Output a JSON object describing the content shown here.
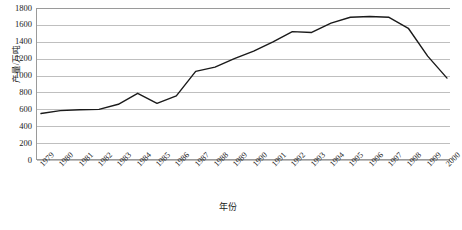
{
  "chart_data": {
    "type": "line",
    "title": "",
    "xlabel": "年份",
    "ylabel": "产量/万吨",
    "categories": [
      "1979",
      "1980",
      "1981",
      "1982",
      "1983",
      "1984",
      "1985",
      "1986",
      "1987",
      "1988",
      "1989",
      "1990",
      "1991",
      "1992",
      "1993",
      "1994",
      "1995",
      "1996",
      "1997",
      "1998",
      "1999",
      "2000"
    ],
    "values": [
      550,
      585,
      595,
      600,
      660,
      790,
      670,
      760,
      1050,
      1100,
      1200,
      1290,
      1400,
      1520,
      1510,
      1620,
      1690,
      1700,
      1690,
      1560,
      1230,
      970
    ],
    "series": [
      {
        "name": "产量",
        "values": [
          550,
          585,
          595,
          600,
          660,
          790,
          670,
          760,
          1050,
          1100,
          1200,
          1290,
          1400,
          1520,
          1510,
          1620,
          1690,
          1700,
          1690,
          1560,
          1230,
          970
        ],
        "color": "#1a1a1a"
      }
    ],
    "ylim": [
      0,
      1800
    ],
    "yticks": [
      0,
      200,
      400,
      600,
      800,
      1000,
      1200,
      1400,
      1600,
      1800
    ],
    "ytick_labels": [
      "0",
      "200",
      "400",
      "600",
      "800",
      "1000",
      "1200",
      "1400",
      "1600",
      "1800"
    ],
    "grid": true,
    "grid_axis": "y",
    "legend": false,
    "legend_position": "none",
    "line_color": "#1a1a1a",
    "grid_color": "#bfbfbf",
    "axis_color": "#9a9a9a",
    "markers": false
  },
  "axes": {
    "y_title": "产量/万吨",
    "x_title": "年份"
  },
  "caption": {
    "text": ""
  }
}
